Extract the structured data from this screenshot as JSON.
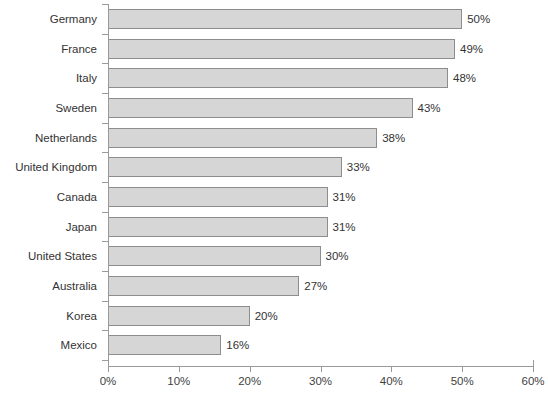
{
  "chart_data": {
    "type": "bar",
    "orientation": "horizontal",
    "title": "",
    "subtitle": "",
    "xlabel": "",
    "ylabel": "",
    "xlim": [
      0,
      60
    ],
    "x_tick_labels": [
      "0%",
      "10%",
      "20%",
      "30%",
      "40%",
      "50%",
      "60%"
    ],
    "x_ticks": [
      0,
      10,
      20,
      30,
      40,
      50,
      60
    ],
    "grid": false,
    "legend": null,
    "value_label_suffix": "%",
    "categories": [
      "Germany",
      "France",
      "Italy",
      "Sweden",
      "Netherlands",
      "United Kingdom",
      "Canada",
      "Japan",
      "United States",
      "Australia",
      "Korea",
      "Mexico"
    ],
    "values": [
      50,
      49,
      48,
      43,
      38,
      33,
      31,
      31,
      30,
      27,
      20,
      16
    ],
    "value_labels": [
      "50%",
      "49%",
      "48%",
      "43%",
      "38%",
      "33%",
      "31%",
      "31%",
      "30%",
      "27%",
      "20%",
      "16%"
    ],
    "colors": {
      "bar_fill": "#d6d6d6",
      "bar_border": "#8d8d8d",
      "axis": "#9a9a9a",
      "text": "#333333",
      "background": "#ffffff"
    }
  }
}
